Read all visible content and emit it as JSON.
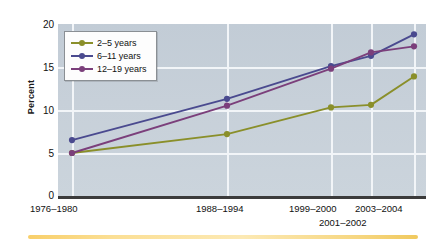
{
  "chart_data": {
    "type": "line",
    "title": "",
    "subtitle": "",
    "xlabel": "",
    "ylabel": "Percent",
    "ylim": [
      0,
      20
    ],
    "yticks": [
      0,
      5,
      10,
      15,
      20
    ],
    "grid": true,
    "legend_position": "top-left",
    "categories": [
      "1976–1980",
      "1988–1994",
      "1999–2000",
      "2001–2002",
      "2003–2004"
    ],
    "series": [
      {
        "name": "2–5 years",
        "color": "#8a8f2a",
        "marker": "circle",
        "values": [
          5.0,
          7.2,
          10.3,
          10.6,
          13.9
        ]
      },
      {
        "name": "6–11 years",
        "color": "#4a4a8f",
        "marker": "circle",
        "values": [
          6.5,
          11.3,
          15.1,
          16.3,
          18.8
        ]
      },
      {
        "name": "12–19 years",
        "color": "#7b3f7b",
        "marker": "circle",
        "values": [
          5.0,
          10.5,
          14.8,
          16.7,
          17.4
        ]
      }
    ]
  },
  "axes": {
    "y_title": "Percent",
    "y_tick_labels": [
      "20",
      "15",
      "10",
      "5",
      "0"
    ],
    "x_tick_labels": [
      "1976–1980",
      "1988–1994",
      "1999–2000",
      "2001–2002",
      "2003–2004"
    ]
  },
  "legend": {
    "entries": [
      {
        "label": "2–5 years",
        "color": "#8a8f2a"
      },
      {
        "label": "6–11 years",
        "color": "#4a4a8f"
      },
      {
        "label": "12–19 years",
        "color": "#7b3f7b"
      }
    ]
  },
  "colors": {
    "plot_background": "#c7d0d9",
    "gridline": "#f2f5f8",
    "axis": "#3b3b3b",
    "accent_rule": "#f8cf6a",
    "series_2_5": "#8a8f2a",
    "series_6_11": "#4a4a8f",
    "series_12_19": "#7b3f7b"
  }
}
